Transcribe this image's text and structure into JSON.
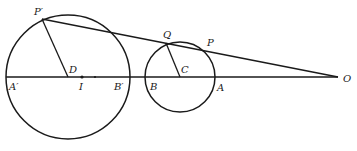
{
  "diagram": {
    "colors": {
      "ink": "#1a1a1a",
      "background": "#ffffff"
    },
    "baseline": {
      "from": [
        6,
        77
      ],
      "to": [
        338,
        77
      ]
    },
    "circles": [
      {
        "name": "large-circle",
        "center": [
          68,
          77
        ],
        "radius": 62
      },
      {
        "name": "small-circle",
        "center": [
          180,
          77
        ],
        "radius": 35
      }
    ],
    "segments": [
      {
        "name": "secant-line",
        "from": [
          42,
          19
        ],
        "to": [
          338,
          77
        ]
      },
      {
        "name": "radius-DP-prime",
        "from": [
          68,
          77
        ],
        "to": [
          42,
          19
        ]
      },
      {
        "name": "radius-CQ",
        "from": [
          180,
          77
        ],
        "to": [
          166,
          43
        ]
      }
    ],
    "dots": [
      {
        "name": "point-I",
        "at": [
          82,
          77
        ]
      },
      {
        "name": "point-mid",
        "at": [
          95,
          77
        ]
      }
    ],
    "labels": {
      "P_prime": "P′",
      "D": "D",
      "I": "I",
      "A_prime": "A′",
      "B_prime": "B′",
      "B": "B",
      "C": "C",
      "Q": "Q",
      "P": "P",
      "A": "A",
      "O": "O"
    }
  }
}
